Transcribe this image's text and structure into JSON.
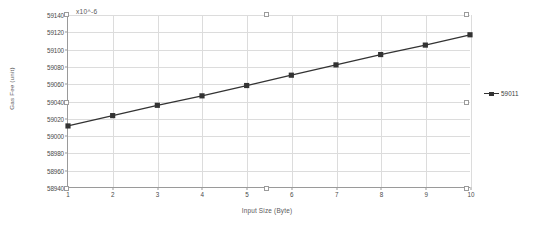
{
  "chart_data": {
    "type": "line",
    "title": "",
    "xlabel": "Input Size (Byte)",
    "ylabel": "Gas Fee (unit)",
    "exponent_note": "x10^-6",
    "x": [
      1,
      2,
      3,
      4,
      5,
      6,
      7,
      8,
      9,
      10
    ],
    "xtick_labels": [
      "1",
      "2",
      "3",
      "4",
      "5",
      "6",
      "7",
      "8",
      "9",
      "10"
    ],
    "ytick_labels": [
      "59140",
      "59120",
      "59100",
      "59080",
      "59060",
      "59040",
      "59020",
      "59000",
      "58980",
      "58960",
      "58940"
    ],
    "ytick_values": [
      59140,
      59120,
      59100,
      59080,
      59060,
      59040,
      59020,
      59000,
      58980,
      58960,
      58940
    ],
    "xlim": [
      1,
      10
    ],
    "ylim": [
      58940,
      59140
    ],
    "grid": true,
    "legend_position": "right",
    "series": [
      {
        "name": "59011",
        "color": "#333333",
        "marker": "square",
        "values": [
          59011,
          59023,
          59035,
          59046,
          59058,
          59070,
          59082,
          59094,
          59105,
          59117
        ]
      }
    ]
  },
  "selection_handles": [
    {
      "x": 64,
      "y": 12
    },
    {
      "x": 264,
      "y": 12
    },
    {
      "x": 464,
      "y": 12
    },
    {
      "x": 64,
      "y": 100
    },
    {
      "x": 464,
      "y": 100
    },
    {
      "x": 64,
      "y": 186
    },
    {
      "x": 264,
      "y": 186
    },
    {
      "x": 464,
      "y": 186
    }
  ]
}
